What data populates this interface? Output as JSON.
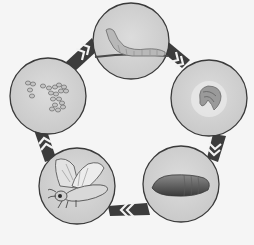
{
  "diagram": {
    "title": "Silkworm life cycle",
    "type": "cycle",
    "direction": "clockwise",
    "colors": {
      "background": "#f5f5f5",
      "circle_fill": "#d2d2d2",
      "circle_stroke": "#3a3a3a",
      "arrow_dark": "#3c3c3c",
      "arrow_light": "#f2f2f2"
    },
    "stages": [
      {
        "id": "larva",
        "label": "Silkworm (larva)",
        "icon": "caterpillar-icon",
        "cx": 131,
        "cy": 41
      },
      {
        "id": "cocoon",
        "label": "Cocoon (spinning)",
        "icon": "cocoon-icon",
        "cx": 209,
        "cy": 98
      },
      {
        "id": "pupa",
        "label": "Pupa",
        "icon": "pupa-icon",
        "cx": 181,
        "cy": 184
      },
      {
        "id": "adult",
        "label": "Adult moth",
        "icon": "moth-icon",
        "cx": 77,
        "cy": 186
      },
      {
        "id": "eggs",
        "label": "Eggs",
        "icon": "eggs-icon",
        "cx": 48,
        "cy": 96
      }
    ],
    "arrows": [
      {
        "from": "larva",
        "to": "cocoon"
      },
      {
        "from": "cocoon",
        "to": "pupa"
      },
      {
        "from": "pupa",
        "to": "adult"
      },
      {
        "from": "adult",
        "to": "eggs"
      },
      {
        "from": "eggs",
        "to": "larva"
      }
    ]
  }
}
